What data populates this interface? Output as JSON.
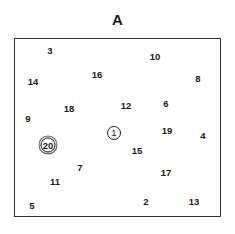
{
  "title": "A",
  "nodes": [
    {
      "label": "1",
      "style": "circled"
    },
    {
      "label": "2"
    },
    {
      "label": "3"
    },
    {
      "label": "4"
    },
    {
      "label": "5"
    },
    {
      "label": "6"
    },
    {
      "label": "7"
    },
    {
      "label": "8"
    },
    {
      "label": "9"
    },
    {
      "label": "10"
    },
    {
      "label": "11"
    },
    {
      "label": "12"
    },
    {
      "label": "13"
    },
    {
      "label": "14"
    },
    {
      "label": "15"
    },
    {
      "label": "16"
    },
    {
      "label": "17"
    },
    {
      "label": "18"
    },
    {
      "label": "19"
    },
    {
      "label": "20",
      "style": "double-circled"
    }
  ]
}
